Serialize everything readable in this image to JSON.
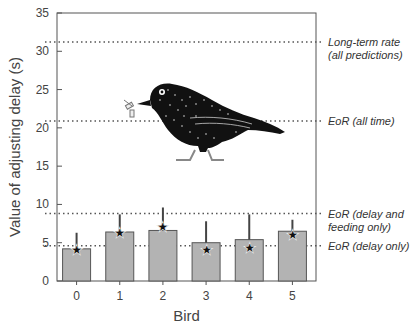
{
  "chart_data": {
    "type": "bar",
    "title": "",
    "xlabel": "Bird",
    "ylabel": "Value of adjusting delay (s)",
    "ylim": [
      0,
      35
    ],
    "yticks": [
      0,
      5,
      10,
      15,
      20,
      25,
      30,
      35
    ],
    "categories": [
      "0",
      "1",
      "2",
      "3",
      "4",
      "5"
    ],
    "values": [
      4.2,
      6.4,
      6.6,
      5.0,
      5.4,
      6.5
    ],
    "error_upper": [
      6.3,
      8.7,
      9.6,
      7.8,
      8.7,
      8.0
    ],
    "star_markers": [
      4.1,
      6.3,
      7.0,
      4.1,
      4.3,
      6.0
    ],
    "reference_lines": [
      {
        "value": 31.2,
        "label_line1": "Long-term rate",
        "label_line2": "(all predictions)"
      },
      {
        "value": 20.9,
        "label_line1": "EoR (all time)",
        "label_line2": ""
      },
      {
        "value": 8.8,
        "label_line1": "EoR (delay and",
        "label_line2": "feeding only)"
      },
      {
        "value": 4.6,
        "label_line1": "EoR (delay only)",
        "label_line2": ""
      }
    ],
    "bar_color": "#b3b3b3",
    "bar_edge_color": "#555555",
    "grid": false,
    "illustration": "starling-bird-with-insect"
  }
}
